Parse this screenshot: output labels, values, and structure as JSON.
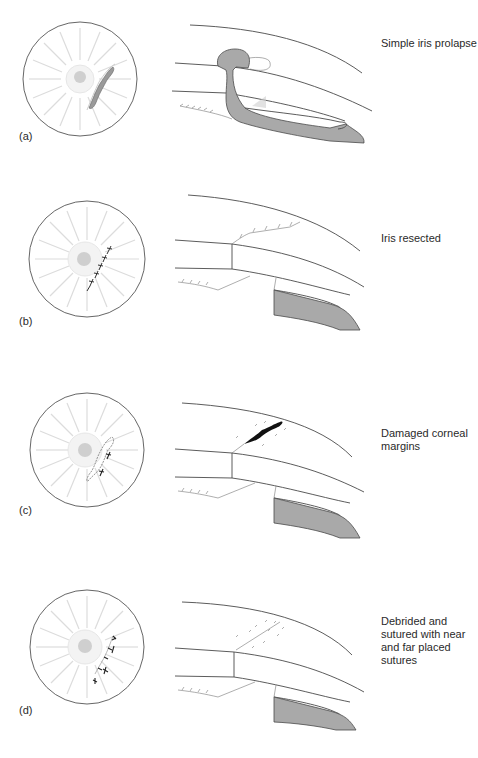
{
  "figure": {
    "panels": [
      {
        "id": "a",
        "label": "(a)",
        "caption": "Simple iris prolapse"
      },
      {
        "id": "b",
        "label": "(b)",
        "caption": "Iris resected"
      },
      {
        "id": "c",
        "label": "(c)",
        "caption": "Damaged corneal margins"
      },
      {
        "id": "d",
        "label": "(d)",
        "caption": "Debrided and sutured with near and far placed sutures"
      }
    ],
    "colors": {
      "outline": "#4a4a4a",
      "iris": "#a9a9a9",
      "rays": "#dcdcdc",
      "pupil": "#cfcfcf",
      "wound": "#111111"
    }
  }
}
